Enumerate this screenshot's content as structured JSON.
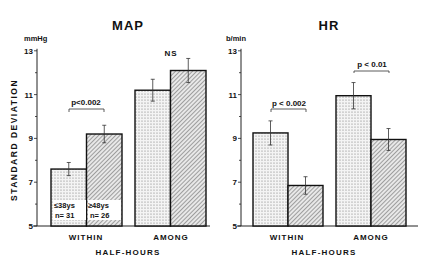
{
  "figure": {
    "shared_ylabel": "STANDARD DEVIATION",
    "xlabel": "HALF-HOURS"
  },
  "legend": {
    "young": {
      "line1": "≤38ys",
      "line2": "n= 31"
    },
    "old": {
      "line1": "≥48ys",
      "line2": "n= 26"
    }
  },
  "chart_data": [
    {
      "type": "bar",
      "title": "MAP",
      "unit": "mmHg",
      "ylabel": "STANDARD DEVIATION",
      "xlabel": "HALF-HOURS",
      "categories": [
        "WITHIN",
        "AMONG"
      ],
      "ylim": [
        5,
        13
      ],
      "yticks": [
        5,
        7,
        9,
        11,
        13
      ],
      "series": [
        {
          "name": "≤38ys n=31",
          "pattern": "dotted",
          "values": [
            7.6,
            11.2
          ],
          "errors": [
            0.3,
            0.5
          ]
        },
        {
          "name": "≥48ys n=26",
          "pattern": "hatched",
          "values": [
            9.2,
            12.1
          ],
          "errors": [
            0.4,
            0.55
          ]
        }
      ],
      "annotations": [
        {
          "category": "WITHIN",
          "text": "p<0.002"
        },
        {
          "category": "AMONG",
          "text": "NS"
        }
      ]
    },
    {
      "type": "bar",
      "title": "HR",
      "unit": "b/min",
      "ylabel": "STANDARD DEVIATION",
      "xlabel": "HALF-HOURS",
      "categories": [
        "WITHIN",
        "AMONG"
      ],
      "ylim": [
        5,
        13
      ],
      "yticks": [
        5,
        7,
        9,
        11,
        13
      ],
      "series": [
        {
          "name": "≤38ys n=31",
          "pattern": "dotted",
          "values": [
            9.25,
            10.95
          ],
          "errors": [
            0.55,
            0.6
          ]
        },
        {
          "name": "≥48ys n=26",
          "pattern": "hatched",
          "values": [
            6.85,
            8.95
          ],
          "errors": [
            0.4,
            0.5
          ]
        }
      ],
      "annotations": [
        {
          "category": "WITHIN",
          "text": "p < 0.002"
        },
        {
          "category": "AMONG",
          "text": "p < 0.01"
        }
      ]
    }
  ]
}
